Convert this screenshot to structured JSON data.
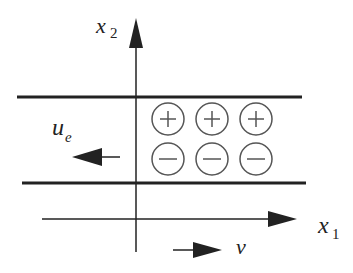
{
  "diagram": {
    "axes": {
      "vertical_label": "x",
      "vertical_subscript": "2",
      "horizontal_label": "x",
      "horizontal_subscript": "1"
    },
    "plates": [
      "top-plate",
      "bottom-plate"
    ],
    "charges": {
      "top_row": [
        "+",
        "+",
        "+"
      ],
      "bottom_row": [
        "−",
        "−",
        "−"
      ]
    },
    "arrows": {
      "electron_velocity_label": "u",
      "electron_velocity_subscript": "e",
      "velocity_label": "v"
    },
    "colors": {
      "line": "#222222",
      "circle": "#555555",
      "background": "#ffffff"
    }
  }
}
